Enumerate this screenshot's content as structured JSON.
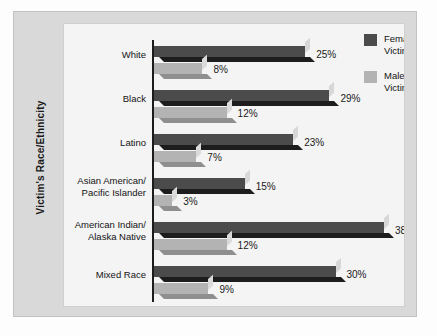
{
  "chart_data": {
    "type": "bar",
    "title": "",
    "xlabel": "",
    "ylabel": "Victim's Race/Ethnicity",
    "orientation": "horizontal",
    "grid": false,
    "xlim": [
      0,
      40
    ],
    "legend_position": "top-right",
    "categories": [
      "White",
      "Black",
      "Latino",
      "Asian American/\nPacific Islander",
      "American Indian/\nAlaska Native",
      "Mixed Race"
    ],
    "series": [
      {
        "name": "Female Victims",
        "color": "#4b4b4b",
        "values": [
          25,
          29,
          23,
          15,
          38,
          30
        ],
        "labels": [
          "25%",
          "29%",
          "23%",
          "15%",
          "38%",
          "30%"
        ]
      },
      {
        "name": "Male Victims",
        "color": "#b3b3b3",
        "values": [
          8,
          12,
          7,
          3,
          12,
          9
        ],
        "labels": [
          "8%",
          "12%",
          "7%",
          "3%",
          "12%",
          "9%"
        ]
      }
    ]
  },
  "legend": {
    "items": [
      {
        "label": "Female\nVictims",
        "swatch": "female"
      },
      {
        "label": "Male\nVictims",
        "swatch": "male"
      }
    ]
  },
  "colors": {
    "female": "#4b4b4b",
    "male": "#b3b3b3",
    "figure_background": "#d9d9d9",
    "panel_background": "#f4f4f4",
    "axis": "#1c1c1c"
  }
}
